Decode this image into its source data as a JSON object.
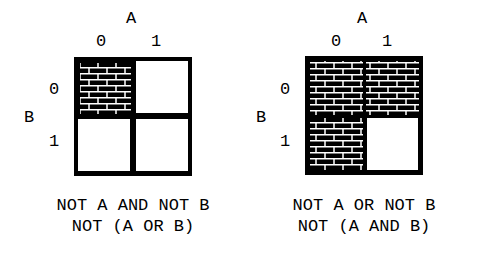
{
  "diagrams": [
    {
      "var_a": "A",
      "var_b": "B",
      "a_values": [
        "0",
        "1"
      ],
      "b_values": [
        "0",
        "1"
      ],
      "shaded": {
        "a0b0": true,
        "a1b0": false,
        "a0b1": false,
        "a1b1": false
      },
      "caption_line1": "NOT A AND NOT B",
      "caption_line2": "NOT (A OR B)"
    },
    {
      "var_a": "A",
      "var_b": "B",
      "a_values": [
        "0",
        "1"
      ],
      "b_values": [
        "0",
        "1"
      ],
      "shaded": {
        "a0b0": true,
        "a1b0": true,
        "a0b1": true,
        "a1b1": false
      },
      "caption_line1": "NOT A OR NOT B",
      "caption_line2": "NOT (A AND B)"
    }
  ],
  "colors": {
    "ink": "#000000",
    "paper": "#ffffff"
  }
}
